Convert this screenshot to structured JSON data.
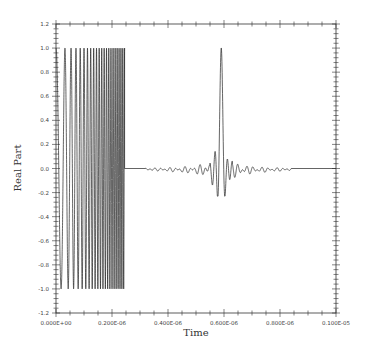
{
  "chart_data": {
    "type": "line",
    "title": "",
    "xlabel": "Time",
    "ylabel": "Real Part",
    "xlim": [
      0.0,
      1e-06
    ],
    "ylim": [
      -1.2,
      1.2
    ],
    "grid": false,
    "legend": null,
    "x_ticks": [
      0.0,
      2e-07,
      4e-07,
      6e-07,
      8e-07,
      1e-06
    ],
    "x_tick_labels": [
      "0.000E+00",
      "0.200E-06",
      "0.400E-06",
      "0.600E-06",
      "0.800E-06",
      "0.100E-05"
    ],
    "y_ticks": [
      -1.2,
      -1.0,
      -0.8,
      -0.6,
      -0.4,
      -0.2,
      0.0,
      0.2,
      0.4,
      0.6,
      0.8,
      1.0,
      1.2
    ],
    "y_tick_labels": [
      "-1.2",
      "-1.0",
      "-0.8",
      "-0.6",
      "-0.4",
      "-0.2",
      "0.0",
      "0.2",
      "0.4",
      "0.6",
      "0.8",
      "1.0",
      "1.2"
    ],
    "series": [
      {
        "name": "Real Part",
        "color": "#222222",
        "segments": [
          {
            "description": "linear chirp, amplitude 1.0, starting at cosine peak",
            "kind": "chirp",
            "t_start": 0.0,
            "t_end": 2.45e-07,
            "amplitude": 1.0,
            "cycles": 22
          },
          {
            "description": "flat zero line",
            "kind": "zero",
            "t_start": 2.45e-07,
            "t_end": 3.2e-07
          },
          {
            "description": "sinc-like compressed pulse with sidelobe ripple, peak 1.0, min about -0.23",
            "kind": "pulse",
            "t_start": 3.2e-07,
            "t_end": 8.4e-07,
            "t_peak": 5.9e-07,
            "peak": 1.0,
            "min": -0.23,
            "ripple_amplitude": 0.04
          },
          {
            "description": "flat zero line",
            "kind": "zero",
            "t_start": 8.4e-07,
            "t_end": 1e-06
          }
        ]
      }
    ]
  },
  "plot": {
    "left": 56,
    "right": 336,
    "top": 24,
    "bottom": 313
  }
}
